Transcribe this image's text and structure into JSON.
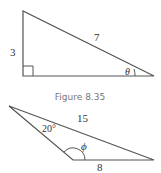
{
  "figure_top": {
    "type": "right-triangle",
    "side_vertical": "3",
    "hypotenuse": "7",
    "angle": "θ"
  },
  "caption": "Figure 8.35",
  "figure_bottom": {
    "type": "obtuse-triangle",
    "side_long": "15",
    "side_base": "8",
    "angle_known": "20°",
    "angle_unknown": "ϕ"
  }
}
